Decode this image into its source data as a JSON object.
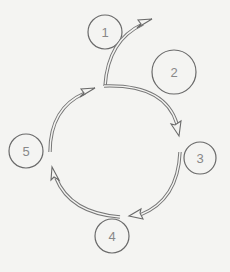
{
  "diagram": {
    "type": "cycle",
    "background": "#f4f4f2",
    "stroke_color": "#6a6a6a",
    "label_color": "#888888",
    "nodes": [
      {
        "id": "1",
        "label": "1",
        "cx": 105,
        "cy": 32,
        "r": 17
      },
      {
        "id": "2",
        "label": "2",
        "cx": 174,
        "cy": 72,
        "r": 22
      },
      {
        "id": "3",
        "label": "3",
        "cx": 200,
        "cy": 158,
        "r": 16
      },
      {
        "id": "4",
        "label": "4",
        "cx": 112,
        "cy": 236,
        "r": 17
      },
      {
        "id": "5",
        "label": "5",
        "cx": 26,
        "cy": 151,
        "r": 17
      }
    ],
    "arrows": [
      {
        "id": "a1",
        "description": "branch from junction upward to the upper right, past node 1"
      },
      {
        "id": "a2",
        "description": "from junction clockwise toward node 3"
      },
      {
        "id": "a3",
        "description": "from node 3 clockwise toward node 4"
      },
      {
        "id": "a4",
        "description": "from node 4 clockwise toward node 5"
      },
      {
        "id": "a5",
        "description": "from node 5 clockwise back toward junction"
      }
    ]
  }
}
